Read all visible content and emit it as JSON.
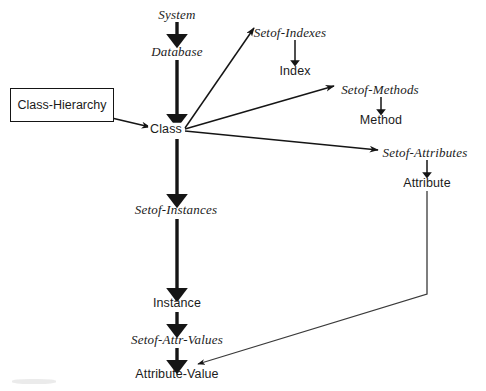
{
  "figure": {
    "background_color": "#ffffff",
    "stroke_color": "#151515",
    "canvas": {
      "width": 486,
      "height": 391
    }
  },
  "nodes": {
    "system": {
      "label": "System",
      "style": "serif-italic",
      "x": 177,
      "y": 14
    },
    "database": {
      "label": "Database",
      "style": "serif-italic",
      "x": 177,
      "y": 51
    },
    "class": {
      "label": "Class",
      "style": "sans",
      "x": 166,
      "y": 129
    },
    "class_hierarchy": {
      "label": "Class-Hierarchy",
      "style": "sans-boxed",
      "x": 62,
      "y": 105
    },
    "setof_indexes": {
      "label": "Setof-Indexes",
      "style": "serif-italic",
      "x": 290,
      "y": 32
    },
    "index": {
      "label": "Index",
      "style": "sans",
      "x": 295,
      "y": 71
    },
    "setof_methods": {
      "label": "Setof-Methods",
      "style": "serif-italic",
      "x": 380,
      "y": 89
    },
    "method": {
      "label": "Method",
      "style": "sans",
      "x": 381,
      "y": 120
    },
    "setof_attributes": {
      "label": "Setof-Attributes",
      "style": "serif-italic",
      "x": 425,
      "y": 152
    },
    "attribute": {
      "label": "Attribute",
      "style": "sans",
      "x": 427,
      "y": 183
    },
    "setof_instances": {
      "label": "Setof-Instances",
      "style": "serif-italic",
      "x": 176,
      "y": 209
    },
    "instance": {
      "label": "Instance",
      "style": "sans",
      "x": 177,
      "y": 303
    },
    "setof_attr_values": {
      "label": "Setof-Attr-Values",
      "style": "serif-italic",
      "x": 177,
      "y": 339
    },
    "attribute_value": {
      "label": "Attribute-Value",
      "style": "sans",
      "x": 177,
      "y": 374
    }
  },
  "edges": [
    {
      "name": "system-to-database",
      "from": "System",
      "to": "Database",
      "kind": "thick-vertical-arrow"
    },
    {
      "name": "database-to-class",
      "from": "Database",
      "to": "Class",
      "kind": "thick-vertical-arrow"
    },
    {
      "name": "class-hierarchy-self-loop",
      "from": "Class-Hierarchy",
      "to": "Class-Hierarchy",
      "kind": "thin-self-loop-arrow"
    },
    {
      "name": "class-hierarchy-to-class",
      "from": "Class-Hierarchy",
      "to": "Class",
      "kind": "thin-diagonal-arrow"
    },
    {
      "name": "class-to-setof-indexes",
      "from": "Class",
      "to": "Setof-Indexes",
      "kind": "thin-diagonal-arrow"
    },
    {
      "name": "class-to-setof-methods",
      "from": "Class",
      "to": "Setof-Methods",
      "kind": "thin-diagonal-arrow"
    },
    {
      "name": "class-to-setof-attributes",
      "from": "Class",
      "to": "Setof-Attributes",
      "kind": "thin-diagonal-arrow"
    },
    {
      "name": "setof-indexes-to-index",
      "from": "Setof-Indexes",
      "to": "Index",
      "kind": "thin-vertical-arrow"
    },
    {
      "name": "setof-methods-to-method",
      "from": "Setof-Methods",
      "to": "Method",
      "kind": "thin-vertical-arrow"
    },
    {
      "name": "setof-attributes-to-attribute",
      "from": "Setof-Attributes",
      "to": "Attribute",
      "kind": "thin-vertical-arrow"
    },
    {
      "name": "class-to-setof-instances",
      "from": "Class",
      "to": "Setof-Instances",
      "kind": "thick-vertical-arrow"
    },
    {
      "name": "setof-instances-to-instance",
      "from": "Setof-Instances",
      "to": "Instance",
      "kind": "thick-vertical-arrow"
    },
    {
      "name": "instance-to-setof-attr-values",
      "from": "Instance",
      "to": "Setof-Attr-Values",
      "kind": "thick-vertical-arrow"
    },
    {
      "name": "setof-attr-values-to-attribute-value",
      "from": "Setof-Attr-Values",
      "to": "Attribute-Value",
      "kind": "thick-vertical-arrow"
    },
    {
      "name": "attribute-to-attribute-value",
      "from": "Attribute",
      "to": "Attribute-Value",
      "kind": "thin-polyline-arrow"
    }
  ]
}
